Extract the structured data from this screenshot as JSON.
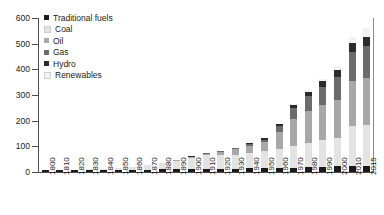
{
  "chart_data": {
    "type": "bar",
    "stacked": true,
    "title": "",
    "xlabel": "",
    "ylabel": "",
    "ylim": [
      0,
      600
    ],
    "yticks": [
      0,
      100,
      200,
      300,
      400,
      500,
      600
    ],
    "grid": false,
    "legend_position": "top-left",
    "categories": [
      "1800",
      "1810",
      "1820",
      "1830",
      "1840",
      "1850",
      "1860",
      "1870",
      "1880",
      "1890",
      "1900",
      "1910",
      "1920",
      "1930",
      "1940",
      "1950",
      "1960",
      "1970",
      "1980",
      "1990",
      "2000",
      "2010",
      "2015"
    ],
    "series": [
      {
        "name": "Traditional fuels",
        "color": "#1a1a1a",
        "values": [
          6,
          6,
          6,
          7,
          7,
          8,
          9,
          9,
          10,
          10,
          11,
          12,
          12,
          13,
          14,
          15,
          16,
          17,
          18,
          20,
          22,
          24,
          25
        ]
      },
      {
        "name": "Coal",
        "color": "#e3e3e3",
        "values": [
          1,
          1,
          2,
          3,
          5,
          8,
          12,
          17,
          24,
          33,
          43,
          53,
          55,
          55,
          62,
          65,
          75,
          85,
          95,
          105,
          110,
          155,
          160
        ]
      },
      {
        "name": "Oil",
        "color": "#a8a8a8",
        "values": [
          0,
          0,
          0,
          0,
          0,
          0,
          0,
          1,
          1,
          2,
          3,
          6,
          12,
          20,
          26,
          36,
          65,
          105,
          125,
          135,
          150,
          175,
          180
        ]
      },
      {
        "name": "Gas",
        "color": "#6b6b6b",
        "values": [
          0,
          0,
          0,
          0,
          0,
          0,
          0,
          0,
          0,
          0,
          1,
          1,
          2,
          4,
          6,
          10,
          22,
          42,
          58,
          73,
          90,
          115,
          125
        ]
      },
      {
        "name": "Hydro",
        "color": "#2b2b2b",
        "values": [
          0,
          0,
          0,
          0,
          0,
          0,
          0,
          0,
          0,
          0,
          1,
          1,
          2,
          3,
          4,
          5,
          8,
          12,
          17,
          22,
          26,
          33,
          37
        ]
      },
      {
        "name": "Renewables",
        "color": "#f2f2f2",
        "values": [
          0,
          0,
          0,
          0,
          0,
          0,
          0,
          0,
          0,
          0,
          0,
          0,
          0,
          0,
          0,
          0,
          1,
          2,
          5,
          9,
          15,
          24,
          33
        ]
      }
    ]
  },
  "legend": {
    "items": [
      {
        "label": "Traditional fuels",
        "color": "#1a1a1a"
      },
      {
        "label": "Coal",
        "color": "#e3e3e3"
      },
      {
        "label": "Oil",
        "color": "#a8a8a8"
      },
      {
        "label": "Gas",
        "color": "#6b6b6b"
      },
      {
        "label": "Hydro",
        "color": "#2b2b2b"
      },
      {
        "label": "Renewables",
        "color": "#f2f2f2"
      }
    ]
  },
  "axes": {
    "y_tick_labels": [
      "600",
      "500",
      "400",
      "300",
      "200",
      "100",
      "0"
    ],
    "axis_color": "#4d4d4d"
  }
}
